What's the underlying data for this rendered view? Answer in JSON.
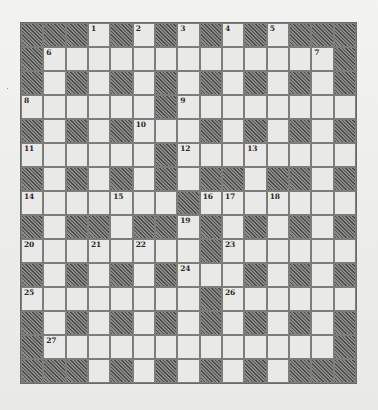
{
  "puzzle": {
    "type": "crossword",
    "rows": 15,
    "cols": 15,
    "colors": {
      "background": "#efefed",
      "white_cell": "#e9e9e7",
      "black_cell_hatch": "#4e4e4c",
      "grid_line": "#7d7d7b",
      "number_text": "#2a2a2a"
    },
    "grid": [
      "###.#.#.#.#.###",
      "#.............#",
      "#.#.#.#.#.#.#.#",
      "......#........",
      "#.#.#...#.#.#.#",
      "......#........",
      "#.#.#.#.##.##.#",
      ".......#.......",
      "#.##.##.#.#.#.#",
      "........#......",
      "#.#.#.#...#.#.#",
      "........#......",
      "#.#.#.#.#.#.#.#",
      "#.............#",
      "###.#.#.#.#.###"
    ],
    "numbers": [
      {
        "row": 0,
        "col": 3,
        "label": "1"
      },
      {
        "row": 0,
        "col": 5,
        "label": "2"
      },
      {
        "row": 0,
        "col": 7,
        "label": "3"
      },
      {
        "row": 0,
        "col": 9,
        "label": "4"
      },
      {
        "row": 0,
        "col": 11,
        "label": "5"
      },
      {
        "row": 1,
        "col": 1,
        "label": "6"
      },
      {
        "row": 1,
        "col": 13,
        "label": "7"
      },
      {
        "row": 3,
        "col": 0,
        "label": "8"
      },
      {
        "row": 3,
        "col": 7,
        "label": "9"
      },
      {
        "row": 4,
        "col": 5,
        "label": "10"
      },
      {
        "row": 5,
        "col": 0,
        "label": "11"
      },
      {
        "row": 5,
        "col": 7,
        "label": "12"
      },
      {
        "row": 5,
        "col": 10,
        "label": "13"
      },
      {
        "row": 7,
        "col": 0,
        "label": "14"
      },
      {
        "row": 7,
        "col": 4,
        "label": "15"
      },
      {
        "row": 7,
        "col": 8,
        "label": "16"
      },
      {
        "row": 7,
        "col": 9,
        "label": "17"
      },
      {
        "row": 7,
        "col": 11,
        "label": "18"
      },
      {
        "row": 8,
        "col": 7,
        "label": "19"
      },
      {
        "row": 9,
        "col": 0,
        "label": "20"
      },
      {
        "row": 9,
        "col": 3,
        "label": "21"
      },
      {
        "row": 9,
        "col": 5,
        "label": "22"
      },
      {
        "row": 9,
        "col": 9,
        "label": "23"
      },
      {
        "row": 10,
        "col": 7,
        "label": "24"
      },
      {
        "row": 11,
        "col": 0,
        "label": "25"
      },
      {
        "row": 11,
        "col": 9,
        "label": "26"
      },
      {
        "row": 13,
        "col": 1,
        "label": "27"
      }
    ],
    "entries": {}
  }
}
